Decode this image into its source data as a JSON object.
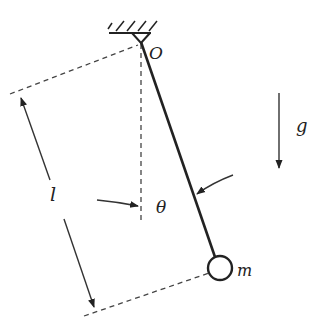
{
  "diagram": {
    "labels": {
      "pivot": "O",
      "length": "l",
      "angle": "θ",
      "mass": "m",
      "gravity": "g"
    },
    "colors": {
      "stroke": "#222222",
      "background": "#ffffff"
    },
    "geometry": {
      "pivot": [
        141,
        40
      ],
      "bob_center": [
        220,
        268
      ],
      "bob_radius": 12
    }
  }
}
